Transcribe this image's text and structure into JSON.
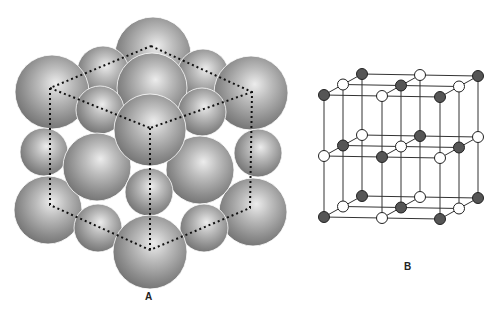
{
  "figure": {
    "panel_a": {
      "label": "A",
      "description": "Close-packed spheres of a face-centered cubic arrangement with dotted cube outline",
      "sphere_color": "#8a8a8a",
      "highlight_color": "#e6e6e6",
      "outline": {
        "style": "dotted",
        "color": "#111111",
        "vertices": {
          "top": [
            151,
            46
          ],
          "upper_left": [
            50,
            88
          ],
          "upper_right": [
            252,
            92
          ],
          "center": [
            150,
            128
          ],
          "lower_left": [
            50,
            205
          ],
          "lower_right": [
            250,
            208
          ],
          "bottom": [
            150,
            250
          ]
        }
      },
      "spheres": [
        {
          "cx": 153,
          "cy": 55,
          "r": 38
        },
        {
          "cx": 103,
          "cy": 72,
          "r": 26
        },
        {
          "cx": 203,
          "cy": 75,
          "r": 26
        },
        {
          "cx": 52,
          "cy": 92,
          "r": 37
        },
        {
          "cx": 251,
          "cy": 93,
          "r": 37
        },
        {
          "cx": 152,
          "cy": 88,
          "r": 35
        },
        {
          "cx": 100,
          "cy": 110,
          "r": 24
        },
        {
          "cx": 202,
          "cy": 112,
          "r": 24
        },
        {
          "cx": 44,
          "cy": 152,
          "r": 24
        },
        {
          "cx": 258,
          "cy": 153,
          "r": 24
        },
        {
          "cx": 48,
          "cy": 210,
          "r": 34
        },
        {
          "cx": 253,
          "cy": 212,
          "r": 34
        },
        {
          "cx": 97,
          "cy": 167,
          "r": 34
        },
        {
          "cx": 200,
          "cy": 170,
          "r": 34
        },
        {
          "cx": 149,
          "cy": 192,
          "r": 24
        },
        {
          "cx": 98,
          "cy": 228,
          "r": 24
        },
        {
          "cx": 204,
          "cy": 228,
          "r": 24
        },
        {
          "cx": 150,
          "cy": 130,
          "r": 36
        },
        {
          "cx": 150,
          "cy": 252,
          "r": 37
        }
      ]
    },
    "panel_b": {
      "label": "B",
      "description": "Ball-and-stick lattice of alternating dark and white ions (rock-salt structure)",
      "dark_color": "#555555",
      "light_color": "#ffffff",
      "line_color": "#333333",
      "origin": [
        324,
        95
      ],
      "step_x": [
        58,
        1
      ],
      "step_y": [
        0,
        61
      ],
      "step_z": [
        19,
        -10.5
      ],
      "node_radius": 5.5,
      "grid_size": 3
    }
  }
}
